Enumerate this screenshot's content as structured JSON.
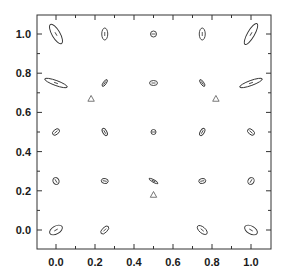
{
  "chart_data": {
    "type": "scatter",
    "title": "",
    "xlabel": "",
    "ylabel": "",
    "xlim": [
      -0.1,
      1.08
    ],
    "ylim": [
      -0.1,
      1.08
    ],
    "grid": false,
    "legend": null,
    "x_ticks": [
      "0.0",
      "0.2",
      "0.4",
      "0.6",
      "0.8",
      "1.0"
    ],
    "y_ticks": [
      "0.0",
      "0.2",
      "0.4",
      "0.6",
      "0.8",
      "1.0"
    ],
    "series": [
      {
        "name": "error ellipses",
        "marker": "ellipse",
        "points": [
          {
            "x": 0.0,
            "y": 1.0,
            "rx": 11,
            "ry": 4,
            "angle": 60
          },
          {
            "x": 0.25,
            "y": 1.0,
            "rx": 6,
            "ry": 3,
            "angle": 90
          },
          {
            "x": 0.5,
            "y": 1.0,
            "rx": 3,
            "ry": 3,
            "angle": 0
          },
          {
            "x": 0.75,
            "y": 1.0,
            "rx": 6,
            "ry": 3,
            "angle": 90
          },
          {
            "x": 1.0,
            "y": 1.0,
            "rx": 12,
            "ry": 3.5,
            "angle": -60
          },
          {
            "x": 0.0,
            "y": 0.75,
            "rx": 12,
            "ry": 2.5,
            "angle": 20
          },
          {
            "x": 0.25,
            "y": 0.75,
            "rx": 4,
            "ry": 1.5,
            "angle": -55
          },
          {
            "x": 0.5,
            "y": 0.75,
            "rx": 4,
            "ry": 2.5,
            "angle": 0
          },
          {
            "x": 0.75,
            "y": 0.75,
            "rx": 4,
            "ry": 1.5,
            "angle": 55
          },
          {
            "x": 1.0,
            "y": 0.75,
            "rx": 12,
            "ry": 2.5,
            "angle": -20
          },
          {
            "x": 0.0,
            "y": 0.5,
            "rx": 4,
            "ry": 2.5,
            "angle": -40
          },
          {
            "x": 0.25,
            "y": 0.5,
            "rx": 4,
            "ry": 2,
            "angle": 60
          },
          {
            "x": 0.5,
            "y": 0.5,
            "rx": 2.5,
            "ry": 2.5,
            "angle": 0
          },
          {
            "x": 0.75,
            "y": 0.5,
            "rx": 4,
            "ry": 2,
            "angle": -60
          },
          {
            "x": 1.0,
            "y": 0.5,
            "rx": 4,
            "ry": 2.5,
            "angle": 40
          },
          {
            "x": 0.0,
            "y": 0.25,
            "rx": 3.5,
            "ry": 3,
            "angle": 60
          },
          {
            "x": 0.25,
            "y": 0.25,
            "rx": 3.5,
            "ry": 2.5,
            "angle": 10
          },
          {
            "x": 0.5,
            "y": 0.25,
            "rx": 5,
            "ry": 1.2,
            "angle": 30
          },
          {
            "x": 0.75,
            "y": 0.25,
            "rx": 3.5,
            "ry": 2.5,
            "angle": -10
          },
          {
            "x": 1.0,
            "y": 0.25,
            "rx": 3.5,
            "ry": 3,
            "angle": -60
          },
          {
            "x": 0.0,
            "y": 0.0,
            "rx": 7,
            "ry": 4,
            "angle": -30
          },
          {
            "x": 0.25,
            "y": 0.0,
            "rx": 5,
            "ry": 2.5,
            "angle": -45
          },
          {
            "x": 0.5,
            "y": 0.0,
            "rx": 0,
            "ry": 0,
            "angle": 0
          },
          {
            "x": 0.75,
            "y": 0.0,
            "rx": 6,
            "ry": 3,
            "angle": 40
          },
          {
            "x": 1.0,
            "y": 0.0,
            "rx": 7,
            "ry": 4,
            "angle": 30
          }
        ]
      },
      {
        "name": "triangles",
        "marker": "triangle",
        "points": [
          {
            "x": 0.18,
            "y": 0.67
          },
          {
            "x": 0.82,
            "y": 0.67
          },
          {
            "x": 0.5,
            "y": 0.18
          }
        ]
      }
    ]
  }
}
